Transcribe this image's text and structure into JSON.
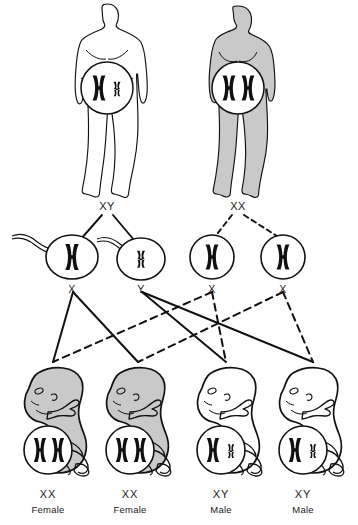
{
  "diagram": {
    "background_color": "#ffffff",
    "line_color": "#111111",
    "shade_color": "#c9c9c9",
    "chromosome_color": "#101010"
  },
  "parents": [
    {
      "id": "father",
      "sex": "male",
      "genotype_label": "XY",
      "shaded": false,
      "chromosomes": [
        "X",
        "Y"
      ],
      "x": 107,
      "y": 207
    },
    {
      "id": "mother",
      "sex": "female",
      "genotype_label": "XX",
      "shaded": true,
      "chromosomes": [
        "X",
        "X"
      ],
      "x": 238,
      "y": 207
    }
  ],
  "gametes": [
    {
      "id": "sperm-x",
      "type": "sperm",
      "allele_label": "X",
      "chromosome": "X",
      "has_tail": true,
      "cx": 72,
      "cy": 257,
      "label_x": 72,
      "label_y": 282
    },
    {
      "id": "sperm-y",
      "type": "sperm",
      "allele_label": "Y",
      "chromosome": "Y",
      "has_tail": true,
      "cx": 141,
      "cy": 259,
      "label_x": 141,
      "label_y": 282
    },
    {
      "id": "egg-x-1",
      "type": "egg",
      "allele_label": "X",
      "chromosome": "X",
      "has_tail": false,
      "cx": 212,
      "cy": 257,
      "label_x": 212,
      "label_y": 282
    },
    {
      "id": "egg-x-2",
      "type": "egg",
      "allele_label": "X",
      "chromosome": "X",
      "has_tail": false,
      "cx": 283,
      "cy": 257,
      "label_x": 283,
      "label_y": 282
    }
  ],
  "offspring": [
    {
      "id": "child-1",
      "genotype_label": "XX",
      "sex_label": "Female",
      "shaded": true,
      "chromosomes": [
        "X",
        "X"
      ],
      "x": 48,
      "geno_y": 494,
      "sex_y": 510
    },
    {
      "id": "child-2",
      "genotype_label": "XX",
      "sex_label": "Female",
      "shaded": true,
      "chromosomes": [
        "X",
        "X"
      ],
      "x": 130,
      "geno_y": 494,
      "sex_y": 510
    },
    {
      "id": "child-3",
      "genotype_label": "XY",
      "sex_label": "Male",
      "shaded": false,
      "chromosomes": [
        "X",
        "Y"
      ],
      "x": 221,
      "geno_y": 494,
      "sex_y": 510
    },
    {
      "id": "child-4",
      "genotype_label": "XY",
      "sex_label": "Male",
      "shaded": false,
      "chromosomes": [
        "X",
        "Y"
      ],
      "x": 303,
      "geno_y": 494,
      "sex_y": 510
    }
  ],
  "connectors": {
    "parent_to_gamete": [
      {
        "from": "father",
        "to": "sperm-x",
        "style": "solid",
        "x1": 102,
        "y1": 215,
        "x2": 80,
        "y2": 240
      },
      {
        "from": "father",
        "to": "sperm-y",
        "style": "solid",
        "x1": 113,
        "y1": 215,
        "x2": 134,
        "y2": 240
      },
      {
        "from": "mother",
        "to": "egg-x-1",
        "style": "dashed",
        "x1": 232,
        "y1": 215,
        "x2": 214,
        "y2": 238
      },
      {
        "from": "mother",
        "to": "egg-x-2",
        "style": "dashed",
        "x1": 244,
        "y1": 215,
        "x2": 280,
        "y2": 238
      }
    ],
    "gamete_to_offspring": [
      {
        "from": "sperm-x",
        "to": "child-1",
        "style": "solid",
        "x1": 73,
        "y1": 292,
        "x2": 53,
        "y2": 362
      },
      {
        "from": "sperm-x",
        "to": "child-2",
        "style": "solid",
        "x1": 73,
        "y1": 292,
        "x2": 138,
        "y2": 362
      },
      {
        "from": "sperm-y",
        "to": "child-3",
        "style": "solid",
        "x1": 142,
        "y1": 292,
        "x2": 226,
        "y2": 362
      },
      {
        "from": "sperm-y",
        "to": "child-4",
        "style": "solid",
        "x1": 142,
        "y1": 292,
        "x2": 313,
        "y2": 362
      },
      {
        "from": "egg-x-1",
        "to": "child-1",
        "style": "dashed",
        "x1": 212,
        "y1": 292,
        "x2": 53,
        "y2": 362
      },
      {
        "from": "egg-x-1",
        "to": "child-3",
        "style": "dashed",
        "x1": 212,
        "y1": 292,
        "x2": 226,
        "y2": 362
      },
      {
        "from": "egg-x-2",
        "to": "child-2",
        "style": "dashed",
        "x1": 283,
        "y1": 292,
        "x2": 138,
        "y2": 362
      },
      {
        "from": "egg-x-2",
        "to": "child-4",
        "style": "dashed",
        "x1": 283,
        "y1": 292,
        "x2": 313,
        "y2": 362
      }
    ]
  }
}
